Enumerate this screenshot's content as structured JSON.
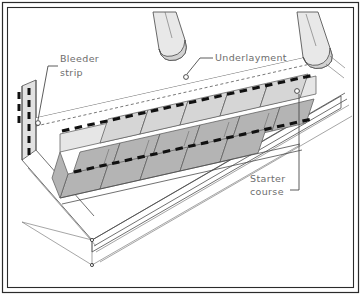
{
  "figure": {
    "canvas": {
      "width": 361,
      "height": 295
    },
    "background_color": "#ffffff",
    "frame": {
      "outer_color": "#2b2b2b",
      "inner_color": "#2b2b2b"
    }
  },
  "labels": [
    {
      "id": "bleeder-strip",
      "line1": "Bleeder",
      "line2": "strip",
      "text_x": 60,
      "text_y": 62,
      "color": "#6d6d6d",
      "marker_x": 38,
      "marker_y": 123
    },
    {
      "id": "underlayment",
      "line1": "Underlayment",
      "line2": "",
      "text_x": 215,
      "text_y": 60,
      "color": "#6d6d6d",
      "marker_x": 186,
      "marker_y": 77
    },
    {
      "id": "starter-course",
      "line1": "Starter",
      "line2": "course",
      "text_x": 250,
      "text_y": 186,
      "color": "#6d6d6d",
      "marker_x": 297,
      "marker_y": 91
    }
  ],
  "legend_note": {
    "adhesive_color": "#111111",
    "shingle_dark_color": "#b4b4b4",
    "shingle_light_color": "#d6d6d6",
    "underlayment_color": "#e2e2e2"
  }
}
